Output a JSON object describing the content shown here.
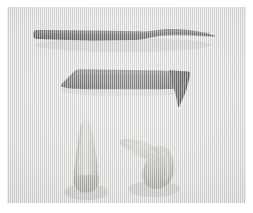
{
  "figure": {
    "medium": "grayscale photograph",
    "orientation": "landscape",
    "plate_background_color": "#dcdcda",
    "page_background_color": "#ffffff",
    "width_px": 253,
    "height_px": 213
  },
  "palette": {
    "page_white": "#ffffff",
    "plate_ground": "#dcdcda",
    "dark_body": "#3f3f3d",
    "dark_body_shade": "#2c2c2b",
    "dark_body_light": "#585856",
    "hook_black": "#121211",
    "light_body": "#bdbcb4",
    "light_body_shade": "#9b9a92",
    "light_body_light": "#d2d1c9",
    "shadow": "#a8a8a4"
  },
  "specimens": [
    {
      "id": "specimen-1",
      "label": "upper dark elongated tapered specimen",
      "tone": "dark",
      "position": "top",
      "shape": "long slender shaft, blunt squared butt at left, gentle waisted constriction near right third, tapering to a fine point at right",
      "fill": "#3f3f3d"
    },
    {
      "id": "specimen-2",
      "label": "second dark specimen with downturned hooked tip",
      "tone": "dark",
      "position": "middle",
      "shape": "straight tapering shaft with angled cut butt at left, terminating at right in a sharply downturned black hook",
      "fill": "#3f3f3d",
      "hook_fill": "#121211"
    },
    {
      "id": "specimen-3",
      "label": "lower left pale conical specimen",
      "tone": "light",
      "position": "bottom-left",
      "shape": "upright elongated cone, rounded apex at top, broad rounded base at bottom",
      "fill": "#bdbcb4"
    },
    {
      "id": "specimen-4",
      "label": "lower right pale bent conical specimen",
      "tone": "light",
      "position": "bottom-right",
      "shape": "bent chevron form, two tapering arms meeting at a rounded elbow, one arm pointing up-left and one pointing down-right",
      "fill": "#bdbcb4"
    }
  ]
}
